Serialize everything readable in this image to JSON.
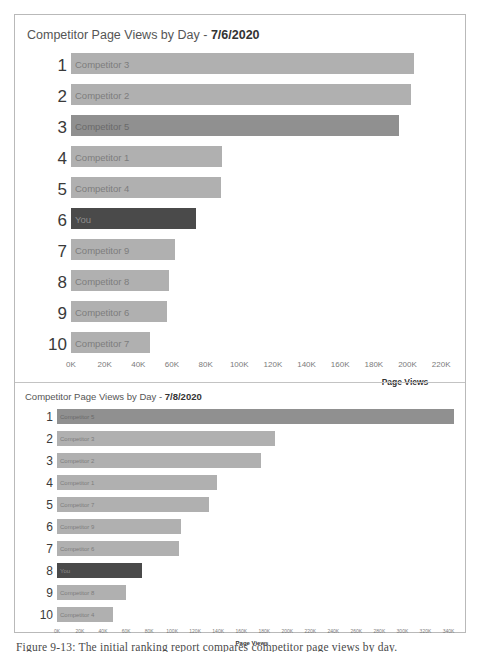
{
  "figure": {
    "caption": "Figure 9-13: The initial ranking report compares competitor page views by day."
  },
  "chart_data": [
    {
      "id": "chart-1",
      "type": "bar",
      "orientation": "horizontal",
      "title_prefix": "Competitor Page Views by Day - ",
      "title_date": "7/6/2020",
      "xlabel": "Page Views",
      "ylabel": "",
      "grid": false,
      "legend": "none",
      "xlim": [
        0,
        230000
      ],
      "tick_labels": [
        "0K",
        "20K",
        "40K",
        "60K",
        "80K",
        "100K",
        "120K",
        "140K",
        "160K",
        "180K",
        "200K",
        "220K"
      ],
      "tick_values": [
        0,
        20000,
        40000,
        60000,
        80000,
        100000,
        120000,
        140000,
        160000,
        180000,
        200000,
        220000
      ],
      "ranks": [
        "1",
        "2",
        "3",
        "4",
        "5",
        "6",
        "7",
        "8",
        "9",
        "10"
      ],
      "categories": [
        "Competitor 3",
        "Competitor 2",
        "Competitor 5",
        "Competitor 1",
        "Competitor 4",
        "You",
        "Competitor 9",
        "Competitor 8",
        "Competitor 6",
        "Competitor 7"
      ],
      "values": [
        204000,
        202000,
        195000,
        90000,
        89000,
        74000,
        62000,
        58000,
        57000,
        47000
      ],
      "highlights": [
        "none",
        "none",
        "mid",
        "none",
        "none",
        "dark",
        "none",
        "none",
        "none",
        "none"
      ]
    },
    {
      "id": "chart-2",
      "type": "bar",
      "orientation": "horizontal",
      "title_prefix": "Competitor Page Views by Day - ",
      "title_date": "7/8/2020",
      "xlabel": "Page Views",
      "ylabel": "",
      "grid": false,
      "legend": "none",
      "xlim": [
        0,
        350000
      ],
      "tick_labels": [
        "0K",
        "20K",
        "40K",
        "60K",
        "80K",
        "100K",
        "120K",
        "140K",
        "160K",
        "180K",
        "200K",
        "220K",
        "240K",
        "260K",
        "280K",
        "300K",
        "320K",
        "340K"
      ],
      "tick_values": [
        0,
        20000,
        40000,
        60000,
        80000,
        100000,
        120000,
        140000,
        160000,
        180000,
        200000,
        220000,
        240000,
        260000,
        280000,
        300000,
        320000,
        340000
      ],
      "ranks": [
        "1",
        "2",
        "3",
        "4",
        "5",
        "6",
        "7",
        "8",
        "9",
        "10"
      ],
      "categories": [
        "Competitor 5",
        "Competitor 3",
        "Competitor 2",
        "Competitor 1",
        "Competitor 7",
        "Competitor 9",
        "Competitor 6",
        "You",
        "Competitor 8",
        "Competitor 4"
      ],
      "values": [
        345000,
        189000,
        177000,
        139000,
        132000,
        108000,
        106000,
        74000,
        60000,
        49000
      ],
      "highlights": [
        "mid",
        "none",
        "none",
        "none",
        "none",
        "none",
        "none",
        "dark",
        "none",
        "none"
      ]
    }
  ],
  "colors": {
    "bar_default": "#b0b0b0",
    "bar_mid": "#909090",
    "bar_dark": "#4a4a4a",
    "frame_border": "#b9b9b9",
    "text": "#3c3c3c"
  }
}
